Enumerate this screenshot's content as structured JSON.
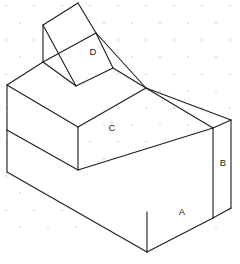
{
  "figure": {
    "projection": "isometric",
    "background_color": "#ffffff",
    "line_color": "#1d1d1d",
    "grid_dot_color": "#d8d4dd",
    "grid_visible": true,
    "canvas": {
      "width": 240,
      "height": 264
    }
  },
  "labels": [
    {
      "id": "A",
      "text": "A",
      "x": 182,
      "y": 212,
      "face": "front-right-lower-face"
    },
    {
      "id": "B",
      "text": "B",
      "x": 223,
      "y": 163,
      "face": "right-end-face"
    },
    {
      "id": "C",
      "text": "C",
      "x": 112,
      "y": 128,
      "face": "middle-top-step-face"
    },
    {
      "id": "D",
      "text": "D",
      "x": 93,
      "y": 52,
      "face": "prism-slant-face"
    }
  ],
  "vertices": {
    "prism_apex_top": [
      78,
      3
    ],
    "prism_left_back": [
      43,
      25
    ],
    "prism_left_front": [
      43,
      62
    ],
    "prism_bottom_mid": [
      76,
      86
    ],
    "prism_right_top": [
      96,
      33
    ],
    "prism_right_low": [
      113,
      68
    ],
    "body_left_top": [
      7,
      85
    ],
    "body_left_mid": [
      7,
      130
    ],
    "body_left_bottom": [
      7,
      172
    ],
    "body_back_top": [
      43,
      62
    ],
    "step_top_left": [
      78,
      85
    ],
    "step_top_right": [
      146,
      88
    ],
    "step_front_left": [
      78,
      127
    ],
    "step_front_mid": [
      78,
      170
    ],
    "step_right_mid": [
      146,
      125
    ],
    "right_top_far": [
      231,
      120
    ],
    "right_bottom_far": [
      231,
      208
    ],
    "right_near_top": [
      213,
      128
    ],
    "right_near_bottom": [
      213,
      218
    ],
    "front_bottom": [
      147,
      252
    ],
    "front_right_low": [
      213,
      218
    ]
  },
  "paths": {
    "prism_slant_face": "M 43,25 L 78,3 L 113,68 L 76,86 Z",
    "prism_left_face": "M 43,25 L 43,62 L 76,86 Z",
    "prism_right_sliver": "M 96,33 L 113,68 L 146,88 Z",
    "top_back_face": "M 7,85 L 43,62 L 146,88 L 78,127 Z",
    "body_left_upper_face": "M 7,85 L 78,127 L 78,170 L 7,130 Z",
    "body_left_lower_face": "M 7,130 L 78,170 L 147,252 L 7,172 Z",
    "front_lower_face": "M 78,170 L 213,128 L 213,218 L 147,252 Z",
    "right_end_face": "M 213,128 L 231,120 L 231,208 L 213,218 Z",
    "right_upper_slope": "M 146,88 L 231,120 L 213,128 Z"
  },
  "edges": [
    {
      "name": "prism-apex-to-left-back",
      "d": "M 78,3 L 43,25"
    },
    {
      "name": "prism-apex-to-right-top",
      "d": "M 78,3 L 96,33"
    },
    {
      "name": "prism-right-top-to-low",
      "d": "M 96,33 L 113,68"
    },
    {
      "name": "prism-left-back-vertical",
      "d": "M 43,25 L 43,62"
    },
    {
      "name": "prism-left-back-to-bottom",
      "d": "M 43,25 L 76,86"
    },
    {
      "name": "prism-left-front-to-bottom",
      "d": "M 43,62 L 76,86"
    },
    {
      "name": "prism-slant-bottom",
      "d": "M 76,86 L 113,68"
    },
    {
      "name": "prism-right-low-to-step",
      "d": "M 113,68 L 146,88"
    },
    {
      "name": "prism-right-top-to-step",
      "d": "M 96,33 L 146,88"
    },
    {
      "name": "top-back-left-edge",
      "d": "M 7,85 L 43,62"
    },
    {
      "name": "top-back-right-edge",
      "d": "M 43,62 L 96,33"
    },
    {
      "name": "step-top-left-to-right",
      "d": "M 78,127 L 146,88"
    },
    {
      "name": "step-top-left-from-body",
      "d": "M 7,85 L 78,127"
    },
    {
      "name": "body-left-vertical-upper",
      "d": "M 7,85 L 7,130"
    },
    {
      "name": "body-left-vertical-lower",
      "d": "M 7,130 L 7,172"
    },
    {
      "name": "step-front-vertical",
      "d": "M 78,127 L 78,170"
    },
    {
      "name": "body-mid-horizontal",
      "d": "M 7,130 L 78,170"
    },
    {
      "name": "body-bottom-left-edge",
      "d": "M 7,172 L 147,252"
    },
    {
      "name": "body-bottom-front-edge",
      "d": "M 147,252 L 213,218"
    },
    {
      "name": "front-lower-top-edge",
      "d": "M 78,170 L 213,128"
    },
    {
      "name": "front-center-vertical",
      "d": "M 147,252 L 147,212"
    },
    {
      "name": "right-near-vertical",
      "d": "M 213,128 L 213,218"
    },
    {
      "name": "right-far-vertical",
      "d": "M 231,120 L 231,208"
    },
    {
      "name": "right-end-top-edge",
      "d": "M 213,128 L 231,120"
    },
    {
      "name": "right-end-bottom-edge",
      "d": "M 213,218 L 231,208"
    },
    {
      "name": "step-right-slope-to-far",
      "d": "M 146,88 L 231,120"
    },
    {
      "name": "step-right-slope-to-near",
      "d": "M 146,88 L 213,128"
    }
  ],
  "grid": {
    "dot_rows": 14,
    "dot_cols": 9,
    "spacing_x": 28,
    "spacing_y": 17,
    "color": "#d8d4dd",
    "radius": 0.9
  }
}
